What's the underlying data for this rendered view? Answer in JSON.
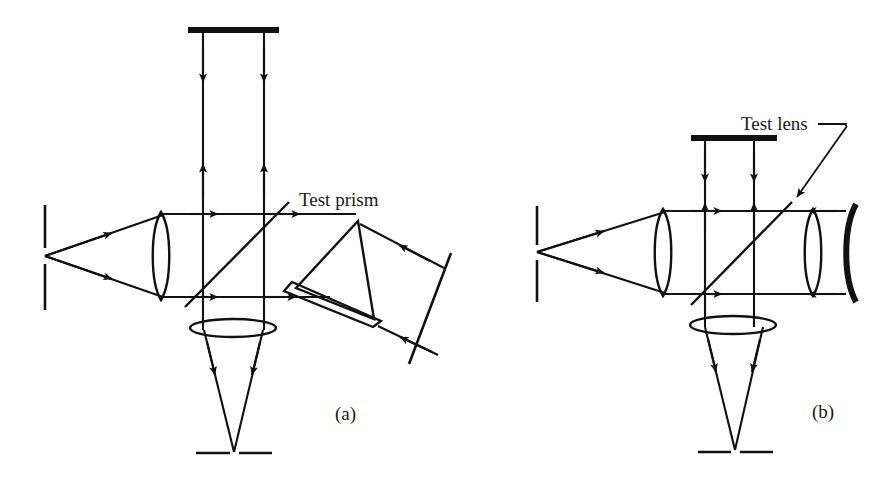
{
  "figure": {
    "background_color": "#ffffff",
    "ink_color": "#111111",
    "width": 893,
    "height": 485
  },
  "labels": {
    "test_prism": "Test prism",
    "test_lens": "Test lens",
    "panel_a": "(a)",
    "panel_b": "(b)"
  },
  "panels": [
    {
      "id": "a",
      "caption": "(a)",
      "caption_pos": [
        340,
        415
      ],
      "label": "Test prism",
      "label_pos": [
        299,
        205
      ],
      "components": [
        {
          "name": "point-source",
          "type": "source",
          "pos": [
            45,
            256
          ]
        },
        {
          "name": "source-slit",
          "type": "slit",
          "x": 45,
          "y_top": 205,
          "y_bottom": 310
        },
        {
          "name": "collimating-lens",
          "type": "biconvex-lens",
          "cx": 161,
          "cy": 256,
          "rx": 11,
          "ry": 44
        },
        {
          "name": "beamsplitter",
          "type": "beamsplitter",
          "x1": 185,
          "y1": 305,
          "x2": 287,
          "y2": 203,
          "angle_deg": 45
        },
        {
          "name": "reference-mirror",
          "type": "flat-mirror",
          "x1": 188,
          "x2": 278,
          "y": 30
        },
        {
          "name": "test-prism",
          "type": "prism",
          "apex": [
            358,
            222
          ],
          "left": [
            296,
            288
          ],
          "right": [
            373,
            318
          ]
        },
        {
          "name": "prism-wedge",
          "type": "wedge",
          "p1": [
            292,
            283
          ],
          "p2": [
            380,
            322
          ],
          "p3": [
            372,
            327
          ],
          "p4": [
            283,
            292
          ]
        },
        {
          "name": "return-mirror",
          "type": "tilted-mirror",
          "x1": 432,
          "y1": 283,
          "x2": 381,
          "y2": 349
        },
        {
          "name": "imaging-lens",
          "type": "thin-lens",
          "cx": 232,
          "cy": 328,
          "rx": 42,
          "ry": 9
        },
        {
          "name": "detector-screen",
          "type": "screen",
          "y": 453,
          "x_left_a": 198,
          "x_left_b": 228,
          "x_right_a": 238,
          "x_right_b": 268
        }
      ]
    },
    {
      "id": "b",
      "caption": "(b)",
      "caption_pos": [
        818,
        412
      ],
      "label": "Test lens",
      "label_pos": [
        741,
        127
      ],
      "components": [
        {
          "name": "point-source",
          "type": "source",
          "pos": [
            537,
            252
          ]
        },
        {
          "name": "source-slit",
          "type": "slit",
          "x": 537,
          "y_top": 206,
          "y_bottom": 302
        },
        {
          "name": "collimating-lens",
          "type": "biconvex-lens",
          "cx": 663,
          "cy": 252,
          "rx": 11,
          "ry": 44
        },
        {
          "name": "beamsplitter",
          "type": "beamsplitter",
          "x1": 693,
          "y1": 303,
          "x2": 790,
          "y2": 204,
          "angle_deg": 45
        },
        {
          "name": "reference-mirror",
          "type": "flat-mirror",
          "x1": 692,
          "x2": 776,
          "y": 138
        },
        {
          "name": "test-lens",
          "type": "biconvex-lens",
          "cx": 813,
          "cy": 252,
          "rx": 11,
          "ry": 43
        },
        {
          "name": "concave-mirror",
          "type": "concave-mirror",
          "x": 850,
          "y_top": 208,
          "y_bottom": 300
        },
        {
          "name": "imaging-lens",
          "type": "thin-lens",
          "cx": 733,
          "cy": 325,
          "rx": 42,
          "ry": 9
        },
        {
          "name": "detector-screen",
          "type": "screen",
          "y": 452,
          "x_left_a": 700,
          "x_left_b": 730,
          "x_right_a": 740,
          "x_right_b": 770
        },
        {
          "name": "test-lens-leader",
          "type": "leader-line",
          "from": [
            811,
            125
          ],
          "corner": [
            843,
            125
          ],
          "to": [
            787,
            200
          ]
        }
      ]
    }
  ]
}
